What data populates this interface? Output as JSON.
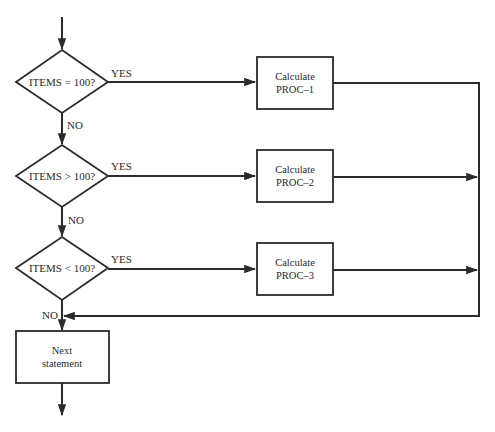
{
  "diagram": {
    "type": "flowchart",
    "colors": {
      "line": "#2b2b2b",
      "text": "#2a2a2a",
      "background": "#ffffff"
    },
    "decisions": [
      {
        "id": "d1",
        "label": "ITEMS = 100?",
        "yes_label": "YES",
        "no_label": "NO"
      },
      {
        "id": "d2",
        "label": "ITEMS > 100?",
        "yes_label": "YES",
        "no_label": "NO"
      },
      {
        "id": "d3",
        "label": "ITEMS < 100?",
        "yes_label": "YES",
        "no_label": "NO"
      }
    ],
    "processes": [
      {
        "id": "p1",
        "line1": "Calculate",
        "line2": "PROC–1"
      },
      {
        "id": "p2",
        "line1": "Calculate",
        "line2": "PROC–2"
      },
      {
        "id": "p3",
        "line1": "Calculate",
        "line2": "PROC–3"
      }
    ],
    "next": {
      "line1": "Next",
      "line2": "statement"
    }
  }
}
